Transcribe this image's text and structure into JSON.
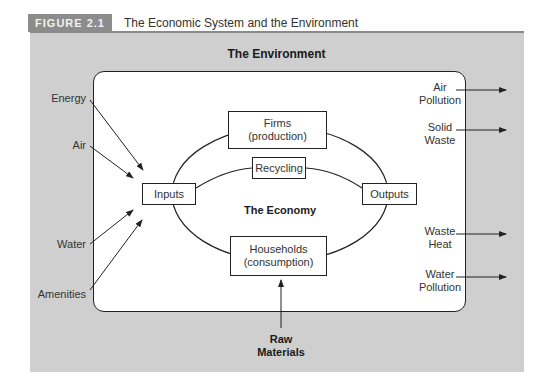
{
  "header": {
    "figure_label": "FIGURE 2.1",
    "title": "The Economic System and the Environment"
  },
  "diagram": {
    "environment_title": "The Environment",
    "economy_title": "The Economy",
    "nodes": {
      "firms": {
        "line1": "Firms",
        "line2": "(production)"
      },
      "recycling": {
        "label": "Recycling"
      },
      "inputs": {
        "label": "Inputs"
      },
      "outputs": {
        "label": "Outputs"
      },
      "households": {
        "line1": "Households",
        "line2": "(consumption)"
      }
    },
    "inputs_from_environment": [
      "Energy",
      "Air",
      "Water",
      "Amenities"
    ],
    "outputs_to_environment": [
      {
        "line1": "Air",
        "line2": "Pollution"
      },
      {
        "line1": "Solid",
        "line2": "Waste"
      },
      {
        "line1": "Waste",
        "line2": "Heat"
      },
      {
        "line1": "Water",
        "line2": "Pollution"
      }
    ],
    "raw_materials": {
      "line1": "Raw",
      "line2": "Materials"
    }
  },
  "colors": {
    "panel_bg": "#cfcfcf",
    "label_bg": "#8c8c8c",
    "line": "#222222"
  }
}
